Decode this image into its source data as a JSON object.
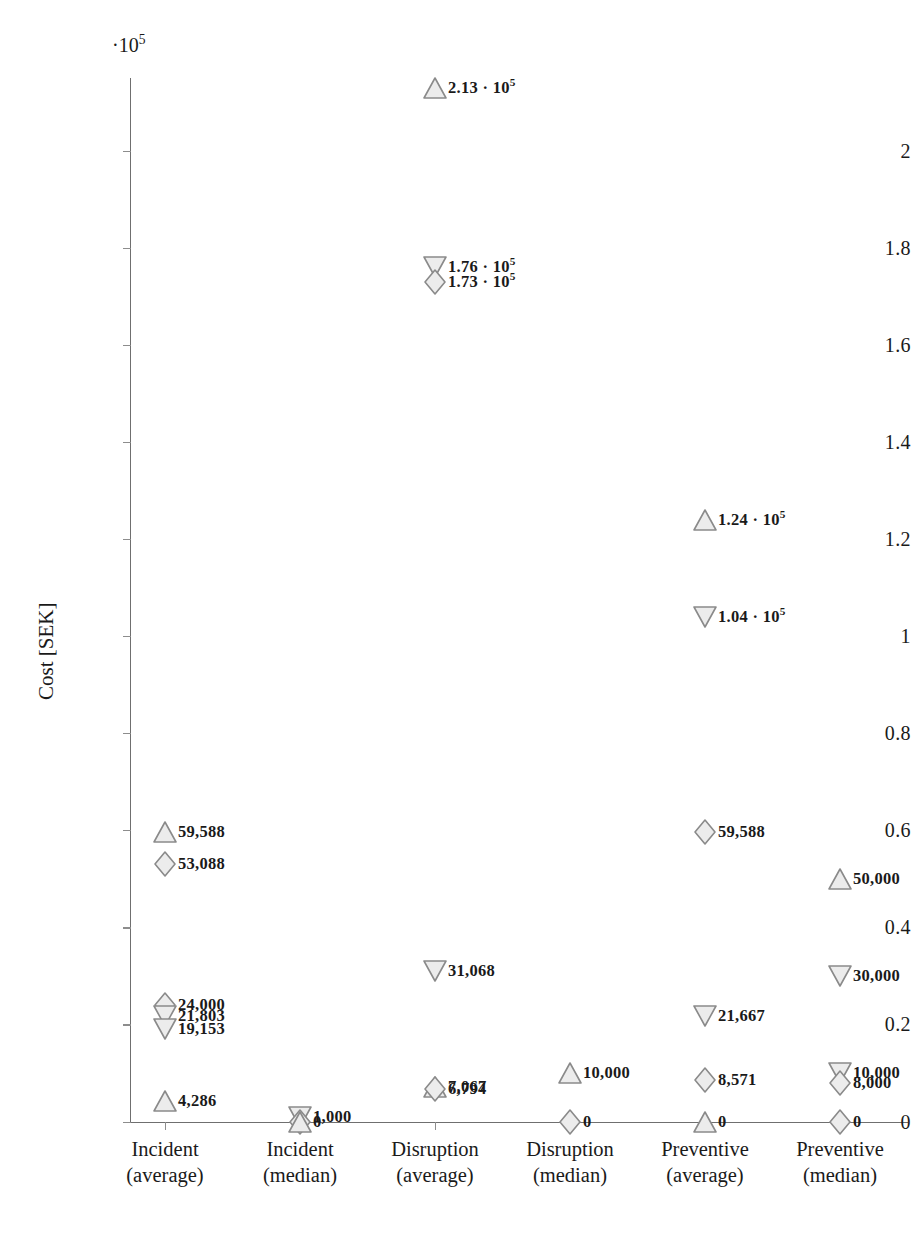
{
  "chart_data": {
    "type": "scatter",
    "title": "",
    "xlabel": "",
    "ylabel": "Cost [SEK]",
    "y_multiplier": "·10",
    "y_multiplier_exp": "5",
    "ylim": [
      0,
      215000
    ],
    "ytick_values": [
      0,
      20000,
      40000,
      60000,
      80000,
      100000,
      120000,
      140000,
      160000,
      180000,
      200000
    ],
    "ytick_labels": [
      "0",
      "0.2",
      "0.4",
      "0.6",
      "0.8",
      "1",
      "1.2",
      "1.4",
      "1.6",
      "1.8",
      "2"
    ],
    "grid": false,
    "legend": "none",
    "categories": [
      "Incident\n(average)",
      "Incident\n(median)",
      "Disruption\n(average)",
      "Disruption\n(median)",
      "Preventive\n(average)",
      "Preventive\n(median)"
    ],
    "xtick_labels": [
      {
        "line1": "Incident",
        "line2": "(average)"
      },
      {
        "line1": "Incident",
        "line2": "(median)"
      },
      {
        "line1": "Disruption",
        "line2": "(average)"
      },
      {
        "line1": "Disruption",
        "line2": "(median)"
      },
      {
        "line1": "Preventive",
        "line2": "(average)"
      },
      {
        "line1": "Preventive",
        "line2": "(median)"
      }
    ],
    "marker_colors": {
      "stroke": "#8a8a8a",
      "fill": "#ececec"
    },
    "points": [
      {
        "category": 0,
        "value": 59588,
        "label": "59,588",
        "marker": "triangle-up"
      },
      {
        "category": 0,
        "value": 53088,
        "label": "53,088",
        "marker": "diamond"
      },
      {
        "category": 0,
        "value": 24000,
        "label": "24,000",
        "marker": "diamond"
      },
      {
        "category": 0,
        "value": 21803,
        "label": "21,803",
        "marker": "triangle-down"
      },
      {
        "category": 0,
        "value": 19153,
        "label": "19,153",
        "marker": "triangle-down"
      },
      {
        "category": 0,
        "value": 4286,
        "label": "4,286",
        "marker": "triangle-up"
      },
      {
        "category": 1,
        "value": 1000,
        "label": "1,000",
        "marker": "triangle-down"
      },
      {
        "category": 1,
        "value": 0,
        "label": "0",
        "marker": "diamond"
      },
      {
        "category": 1,
        "value": 0,
        "label": "",
        "marker": "triangle-up"
      },
      {
        "category": 2,
        "value": 213000,
        "label": "2.13 · 10",
        "label_exp": "5",
        "marker": "triangle-up"
      },
      {
        "category": 2,
        "value": 176000,
        "label": "1.76 · 10",
        "label_exp": "5",
        "marker": "triangle-down"
      },
      {
        "category": 2,
        "value": 173000,
        "label": "1.73 · 10",
        "label_exp": "5",
        "marker": "diamond"
      },
      {
        "category": 2,
        "value": 31068,
        "label": "31,068",
        "marker": "triangle-down"
      },
      {
        "category": 2,
        "value": 7067,
        "label": "7,067",
        "marker": "triangle-up"
      },
      {
        "category": 2,
        "value": 6794,
        "label": "6,794",
        "marker": "diamond"
      },
      {
        "category": 3,
        "value": 10000,
        "label": "10,000",
        "marker": "triangle-up"
      },
      {
        "category": 3,
        "value": 0,
        "label": "0",
        "marker": "diamond"
      },
      {
        "category": 4,
        "value": 124000,
        "label": "1.24 · 10",
        "label_exp": "5",
        "marker": "triangle-up"
      },
      {
        "category": 4,
        "value": 104000,
        "label": "1.04 · 10",
        "label_exp": "5",
        "marker": "triangle-down"
      },
      {
        "category": 4,
        "value": 59588,
        "label": "59,588",
        "marker": "diamond"
      },
      {
        "category": 4,
        "value": 21667,
        "label": "21,667",
        "marker": "triangle-down"
      },
      {
        "category": 4,
        "value": 8571,
        "label": "8,571",
        "marker": "diamond"
      },
      {
        "category": 4,
        "value": 0,
        "label": "0",
        "marker": "triangle-up"
      },
      {
        "category": 5,
        "value": 50000,
        "label": "50,000",
        "marker": "triangle-up"
      },
      {
        "category": 5,
        "value": 30000,
        "label": "30,000",
        "marker": "triangle-down"
      },
      {
        "category": 5,
        "value": 10000,
        "label": "10,000",
        "marker": "triangle-down"
      },
      {
        "category": 5,
        "value": 8000,
        "label": "8,000",
        "marker": "diamond"
      },
      {
        "category": 5,
        "value": 0,
        "label": "0",
        "marker": "diamond"
      }
    ]
  }
}
